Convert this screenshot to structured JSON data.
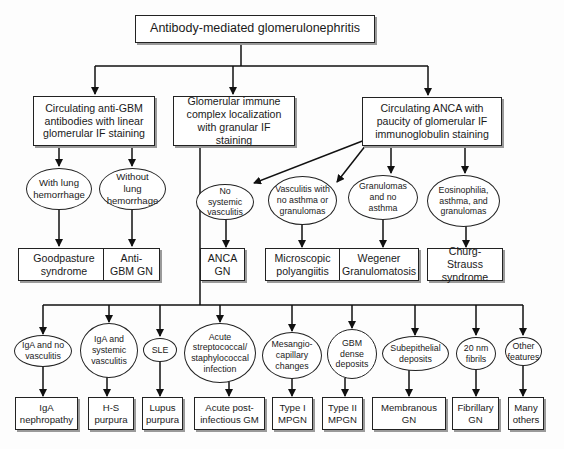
{
  "root": {
    "label": "Antibody-mediated glomerulonephritis"
  },
  "categories": [
    {
      "label": "Circulating anti-GBM antibodies with linear glomerular IF staining"
    },
    {
      "label": "Glomerular immune complex localization with granular IF staining"
    },
    {
      "label": "Circulating ANCA with paucity of glomerular IF immunoglobulin staining"
    }
  ],
  "anti_gbm": {
    "features": [
      "With lung hemorrhage",
      "Without lung hemorrhage"
    ],
    "diseases": [
      "Goodpasture syndrome",
      "Anti-GBM GN"
    ]
  },
  "anca": {
    "features": [
      "No systemic vasculitis",
      "Vasculitis with no asthma or granulomas",
      "Granulomas and no asthma",
      "Eosinophilia, asthma, and granulomas"
    ],
    "diseases": [
      "ANCA GN",
      "Microscopic polyangiitis",
      "Wegener Granulomatosis",
      "Churg-Strauss syndrome"
    ]
  },
  "immune_complex": {
    "features": [
      "IgA and no vasculitis",
      "IgA and systemic vasculitis",
      "SLE",
      "Acute streptococcal/ staphylococcal infection",
      "Mesangio-capillary changes",
      "GBM dense deposits",
      "Subepithelial deposits",
      "20 nm fibrils",
      "Other features"
    ],
    "diseases": [
      "IgA nephropathy",
      "H-S purpura",
      "Lupus purpura",
      "Acute post-infectious GM",
      "Type I MPGN",
      "Type II MPGN",
      "Membranous GN",
      "Fibrillary GN",
      "Many others"
    ]
  }
}
